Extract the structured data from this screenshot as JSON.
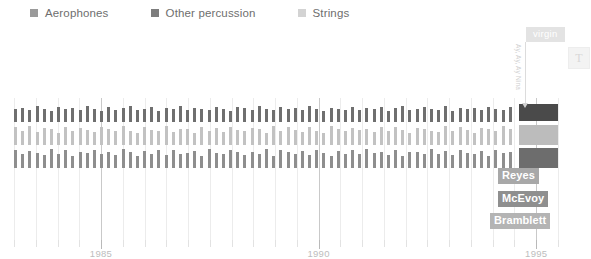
{
  "legend": {
    "items": [
      {
        "label": "Aerophones",
        "color": "#9a9a9a",
        "name": "legend-item-aerophones"
      },
      {
        "label": "Other percussion",
        "color": "#7d7d7d",
        "name": "legend-item-other-percussion"
      },
      {
        "label": "Strings",
        "color": "#d3d3d3",
        "name": "legend-item-strings"
      }
    ]
  },
  "toolbar": {
    "text_tool_label": "T"
  },
  "annotations": {
    "badge_label": "virgin",
    "badge_color": "#e3e3e3",
    "rotated_note": "Ay, Ay, Ay Nina",
    "names": [
      {
        "label": "Reyes",
        "bg": "#a8a8a8"
      },
      {
        "label": "McEvoy",
        "bg": "#8f8f8f"
      },
      {
        "label": "Bramblett",
        "bg": "#b4b4b4"
      }
    ]
  },
  "chart_data": {
    "type": "bar",
    "title": "",
    "xlabel": "",
    "ylabel": "",
    "xlim": [
      1983.0,
      1995.5
    ],
    "xticks": [
      1985,
      1990,
      1995
    ],
    "xtick_labels": [
      "1985",
      "1990",
      "1995"
    ],
    "minor_tick_step": 0.5,
    "grid": true,
    "legend_position": "top-left",
    "orientation": "horizontal-timeline",
    "rows": [
      {
        "name": "Aerophones",
        "color": "#6f6f6f",
        "highlight_color": "#4a4a4a",
        "values": [
          0.72,
          0.8,
          0.66,
          0.9,
          0.74,
          0.62,
          0.86,
          0.7,
          0.78,
          0.64,
          0.88,
          0.72,
          0.6,
          0.82,
          0.68,
          0.76,
          0.9,
          0.66,
          0.74,
          0.84,
          0.62,
          0.78,
          0.7,
          0.88,
          0.64,
          0.8,
          0.72,
          0.66,
          0.86,
          0.74,
          0.6,
          0.82,
          0.78,
          0.68,
          0.9,
          0.72,
          0.64,
          0.84,
          0.7,
          0.76,
          0.66,
          0.88,
          0.74,
          0.62,
          0.8,
          0.72,
          0.68,
          0.86,
          0.64,
          0.78,
          0.7,
          0.82,
          0.6,
          0.76,
          0.88,
          0.66,
          0.74,
          0.84,
          0.72,
          0.68,
          0.9,
          0.62,
          0.78,
          0.7,
          0.8,
          0.66,
          0.86,
          0.74,
          0.64,
          0.82
        ]
      },
      {
        "name": "Strings",
        "color": "#c2c2c2",
        "highlight_color": "#bcbcbc",
        "values": [
          0.88,
          0.72,
          0.95,
          0.66,
          0.84,
          0.78,
          0.6,
          0.92,
          0.7,
          0.86,
          0.74,
          0.64,
          0.9,
          0.8,
          0.68,
          0.96,
          0.72,
          0.62,
          0.88,
          0.76,
          0.7,
          0.94,
          0.66,
          0.82,
          0.78,
          0.6,
          0.9,
          0.72,
          0.86,
          0.64,
          0.92,
          0.74,
          0.68,
          0.84,
          0.8,
          0.62,
          0.96,
          0.7,
          0.88,
          0.76,
          0.66,
          0.9,
          0.72,
          0.6,
          0.94,
          0.78,
          0.68,
          0.86,
          0.74,
          0.82,
          0.64,
          0.92,
          0.7,
          0.88,
          0.76,
          0.62,
          0.84,
          0.8,
          0.72,
          0.66,
          0.96,
          0.68,
          0.9,
          0.74,
          0.6,
          0.86,
          0.78,
          0.7,
          0.94,
          0.82
        ]
      },
      {
        "name": "Other percussion",
        "color": "#8e8e8e",
        "highlight_color": "#6d6d6d",
        "values": [
          0.92,
          0.7,
          0.84,
          0.76,
          0.64,
          0.96,
          0.72,
          0.88,
          0.6,
          0.8,
          0.74,
          0.9,
          0.68,
          0.82,
          0.66,
          0.94,
          0.78,
          0.62,
          0.86,
          0.72,
          0.88,
          0.64,
          0.92,
          0.7,
          0.76,
          0.84,
          0.6,
          0.96,
          0.74,
          0.68,
          0.9,
          0.8,
          0.66,
          0.82,
          0.72,
          0.94,
          0.62,
          0.88,
          0.78,
          0.7,
          0.86,
          0.64,
          0.92,
          0.76,
          0.6,
          0.84,
          0.72,
          0.9,
          0.68,
          0.96,
          0.74,
          0.8,
          0.66,
          0.88,
          0.62,
          0.82,
          0.78,
          0.7,
          0.94,
          0.72,
          0.86,
          0.64,
          0.9,
          0.76,
          0.68,
          0.84,
          0.6,
          0.92,
          0.74,
          0.8
        ]
      }
    ],
    "highlight_column": {
      "x": 1995.0,
      "label": "virgin",
      "block_colors": [
        "#4a4a4a",
        "#bcbcbc",
        "#6d6d6d"
      ]
    }
  }
}
